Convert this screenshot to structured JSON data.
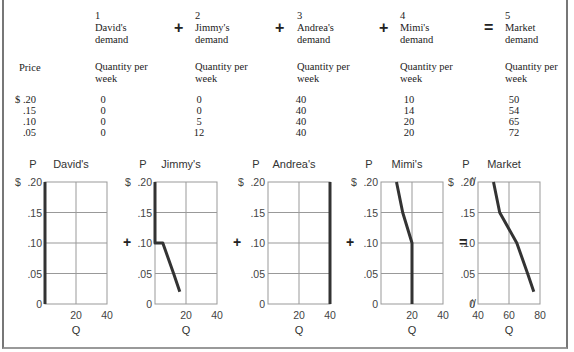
{
  "table": {
    "price_header": "Price",
    "columns": [
      {
        "num": "1",
        "title1": "David's",
        "title2": "demand",
        "sub1": "Quantity per",
        "sub2": "week"
      },
      {
        "num": "2",
        "title1": "Jimmy's",
        "title2": "demand",
        "sub1": "Quantity per",
        "sub2": "week"
      },
      {
        "num": "3",
        "title1": "Andrea's",
        "title2": "demand",
        "sub1": "Quantity per",
        "sub2": "week"
      },
      {
        "num": "4",
        "title1": "Mimi's",
        "title2": "demand",
        "sub1": "Quantity per",
        "sub2": "week"
      },
      {
        "num": "5",
        "title1": "Market",
        "title2": "demand",
        "sub1": "Quantity per",
        "sub2": "week"
      }
    ],
    "operators": [
      "+",
      "+",
      "+",
      "="
    ],
    "rows": [
      {
        "price": "$ .20",
        "values": [
          "0",
          "0",
          "40",
          "10",
          "50"
        ]
      },
      {
        "price": ".15",
        "values": [
          "0",
          "0",
          "40",
          "14",
          "54"
        ]
      },
      {
        "price": ".10",
        "values": [
          "0",
          "5",
          "40",
          "20",
          "65"
        ]
      },
      {
        "price": ".05",
        "values": [
          "0",
          "12",
          "40",
          "20",
          "72"
        ]
      }
    ]
  },
  "chart_data": [
    {
      "type": "line",
      "title": "David's",
      "xlabel": "Q",
      "ylabel": "P",
      "xlim": [
        0,
        40
      ],
      "ylim": [
        0,
        0.2
      ],
      "xticks": [
        "20",
        "40"
      ],
      "yticks": [
        "0",
        ".05",
        ".10",
        ".15",
        "$ .20"
      ],
      "series": [
        {
          "name": "David's demand",
          "x": [
            0,
            0
          ],
          "y": [
            0,
            0.2
          ]
        }
      ]
    },
    {
      "type": "line",
      "title": "Jimmy's",
      "xlabel": "Q",
      "ylabel": "P",
      "xlim": [
        0,
        40
      ],
      "ylim": [
        0,
        0.2
      ],
      "xticks": [
        "20",
        "40"
      ],
      "yticks": [
        "0",
        ".05",
        ".10",
        ".15",
        "$ .20"
      ],
      "series": [
        {
          "name": "Jimmy's demand",
          "x": [
            0,
            0,
            5,
            12,
            16
          ],
          "y": [
            0.2,
            0.1,
            0.1,
            0.05,
            0.02
          ]
        }
      ]
    },
    {
      "type": "line",
      "title": "Andrea's",
      "xlabel": "Q",
      "ylabel": "P",
      "xlim": [
        0,
        40
      ],
      "ylim": [
        0,
        0.2
      ],
      "xticks": [
        "20",
        "40"
      ],
      "yticks": [
        "0",
        ".05",
        ".10",
        ".15",
        "$ .20"
      ],
      "series": [
        {
          "name": "Andrea's demand",
          "x": [
            40,
            40
          ],
          "y": [
            0,
            0.2
          ]
        }
      ]
    },
    {
      "type": "line",
      "title": "Mimi's",
      "xlabel": "Q",
      "ylabel": "P",
      "xlim": [
        0,
        40
      ],
      "ylim": [
        0,
        0.2
      ],
      "xticks": [
        "20",
        "40"
      ],
      "yticks": [
        "0",
        ".05",
        ".10",
        ".15",
        "$ .20"
      ],
      "series": [
        {
          "name": "Mimi's demand",
          "x": [
            10,
            14,
            20,
            20
          ],
          "y": [
            0.2,
            0.15,
            0.1,
            0
          ]
        }
      ]
    },
    {
      "type": "line",
      "title": "Market",
      "xlabel": "Q",
      "ylabel": "P",
      "xlim": [
        40,
        80
      ],
      "ylim": [
        0,
        0.2
      ],
      "xticks": [
        "40",
        "60",
        "80"
      ],
      "yticks": [
        "0",
        ".05",
        ".10",
        ".15",
        "$ .20"
      ],
      "axis_break": true,
      "series": [
        {
          "name": "Market demand",
          "x": [
            50,
            54,
            65,
            72,
            76
          ],
          "y": [
            0.2,
            0.15,
            0.1,
            0.05,
            0.02
          ]
        }
      ]
    }
  ],
  "graph_operators": [
    "+",
    "+",
    "+",
    "="
  ]
}
